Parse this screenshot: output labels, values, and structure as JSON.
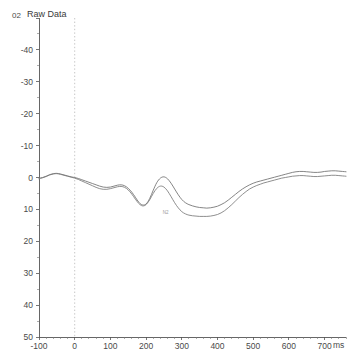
{
  "plot": {
    "title": "Raw Data",
    "channel_label": "02",
    "peak_annotation": "N2"
  },
  "chart_data": {
    "type": "line",
    "title": "Raw Data",
    "xlabel": "ms",
    "ylabel": "",
    "x_unit": "ms",
    "xlim": [
      -100,
      760
    ],
    "ylim": [
      50,
      -50
    ],
    "y_inverted": true,
    "grid": false,
    "legend": "none",
    "x_ticks": [
      -100,
      0,
      100,
      200,
      300,
      400,
      500,
      600,
      700
    ],
    "x_tick_labels": [
      "-100",
      "0",
      "100",
      "200",
      "300",
      "400",
      "500",
      "600",
      "700"
    ],
    "y_ticks": [
      -50,
      -40,
      -30,
      -20,
      -10,
      0,
      10,
      20,
      30,
      40,
      50
    ],
    "y_tick_labels": [
      "02",
      "-40",
      "-30",
      "-20",
      "-10",
      "0",
      "10",
      "20",
      "30",
      "40",
      "50"
    ],
    "annotations": [
      {
        "text": "N2",
        "x": 255,
        "y": 11.5
      }
    ],
    "markers": [
      {
        "type": "vline",
        "x": 0,
        "style": "dotted",
        "color": "#b8b8b8"
      }
    ],
    "x": [
      -100,
      -90,
      -80,
      -70,
      -60,
      -50,
      -40,
      -30,
      -20,
      -10,
      0,
      10,
      20,
      30,
      40,
      50,
      60,
      70,
      80,
      90,
      100,
      110,
      120,
      130,
      140,
      150,
      160,
      170,
      180,
      190,
      200,
      210,
      220,
      230,
      240,
      250,
      260,
      270,
      280,
      290,
      300,
      310,
      320,
      330,
      340,
      350,
      360,
      370,
      380,
      390,
      400,
      410,
      420,
      430,
      440,
      450,
      460,
      470,
      480,
      490,
      500,
      510,
      520,
      530,
      540,
      550,
      560,
      570,
      580,
      590,
      600,
      610,
      620,
      630,
      640,
      650,
      660,
      670,
      680,
      690,
      700,
      710,
      720,
      730,
      740,
      750,
      760
    ],
    "series": [
      {
        "name": "Trace 1",
        "color": "#6f6f6f",
        "values": [
          0.2,
          0.0,
          -0.4,
          -0.9,
          -1.2,
          -1.3,
          -1.1,
          -0.8,
          -0.5,
          -0.2,
          0.0,
          0.3,
          0.7,
          1.1,
          1.5,
          1.9,
          2.3,
          2.7,
          3.0,
          3.1,
          3.0,
          2.7,
          2.4,
          2.3,
          2.6,
          3.4,
          4.6,
          6.2,
          7.8,
          8.6,
          8.3,
          6.6,
          4.0,
          1.6,
          0.2,
          -0.2,
          0.4,
          1.8,
          3.6,
          5.4,
          6.9,
          7.9,
          8.5,
          8.9,
          9.2,
          9.4,
          9.5,
          9.6,
          9.5,
          9.3,
          9.0,
          8.5,
          7.9,
          7.1,
          6.2,
          5.3,
          4.4,
          3.6,
          2.9,
          2.3,
          1.8,
          1.4,
          1.1,
          0.8,
          0.5,
          0.2,
          -0.1,
          -0.4,
          -0.7,
          -1.0,
          -1.3,
          -1.6,
          -1.8,
          -1.9,
          -1.9,
          -1.8,
          -1.7,
          -1.6,
          -1.6,
          -1.7,
          -1.9,
          -2.0,
          -2.1,
          -2.1,
          -2.0,
          -1.9,
          -1.8
        ]
      },
      {
        "name": "Trace 2",
        "color": "#7a7a7a",
        "values": [
          0.4,
          0.1,
          -0.3,
          -0.8,
          -1.1,
          -1.2,
          -1.0,
          -0.7,
          -0.4,
          -0.1,
          0.2,
          0.6,
          1.1,
          1.6,
          2.1,
          2.6,
          3.1,
          3.5,
          3.7,
          3.7,
          3.5,
          3.2,
          2.9,
          2.8,
          3.1,
          3.9,
          5.2,
          6.8,
          8.2,
          8.9,
          8.5,
          7.0,
          5.0,
          3.4,
          2.7,
          3.0,
          4.2,
          6.0,
          7.9,
          9.5,
          10.7,
          11.4,
          11.8,
          12.0,
          12.1,
          12.2,
          12.2,
          12.2,
          12.1,
          11.9,
          11.6,
          11.1,
          10.4,
          9.5,
          8.5,
          7.4,
          6.3,
          5.3,
          4.4,
          3.6,
          3.0,
          2.5,
          2.1,
          1.7,
          1.4,
          1.1,
          0.8,
          0.5,
          0.2,
          0.0,
          -0.2,
          -0.4,
          -0.5,
          -0.6,
          -0.6,
          -0.5,
          -0.4,
          -0.3,
          -0.3,
          -0.4,
          -0.5,
          -0.6,
          -0.7,
          -0.7,
          -0.6,
          -0.5,
          -0.4
        ]
      }
    ]
  }
}
